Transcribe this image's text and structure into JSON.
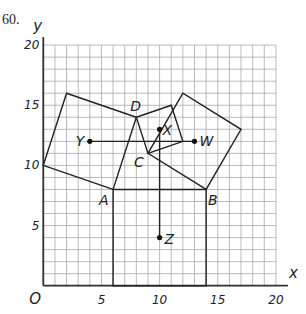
{
  "problem_number": "60.",
  "axes": {
    "x_label": "x",
    "y_label": "y",
    "origin_label": "O",
    "x_ticks": [
      {
        "v": 5,
        "label": "5"
      },
      {
        "v": 10,
        "label": "10"
      },
      {
        "v": 15,
        "label": "15"
      },
      {
        "v": 20,
        "label": "20"
      }
    ],
    "y_ticks": [
      {
        "v": 5,
        "label": "5"
      },
      {
        "v": 10,
        "label": "10"
      },
      {
        "v": 15,
        "label": "15"
      },
      {
        "v": 20,
        "label": "20"
      }
    ],
    "range": {
      "xmin": 0,
      "xmax": 20,
      "ymin": 0,
      "ymax": 20
    },
    "grid_step": 1
  },
  "quadrilateral": {
    "vertices": [
      {
        "name": "A",
        "x": 6,
        "y": 8
      },
      {
        "name": "B",
        "x": 14,
        "y": 8
      },
      {
        "name": "C",
        "x": 9,
        "y": 11
      },
      {
        "name": "D",
        "x": 8,
        "y": 14
      }
    ]
  },
  "squares": [
    {
      "side": "AB",
      "points": [
        [
          6,
          8
        ],
        [
          14,
          8
        ],
        [
          14,
          0
        ],
        [
          6,
          0
        ]
      ]
    },
    {
      "side": "BC",
      "points": [
        [
          14,
          8
        ],
        [
          9,
          11
        ],
        [
          12,
          16
        ],
        [
          17,
          13
        ]
      ]
    },
    {
      "side": "CD",
      "points": [
        [
          9,
          11
        ],
        [
          8,
          14
        ],
        [
          11,
          15
        ],
        [
          12,
          12
        ]
      ]
    },
    {
      "side": "DA",
      "points": [
        [
          8,
          14
        ],
        [
          6,
          8
        ],
        [
          0,
          10
        ],
        [
          2,
          16
        ]
      ]
    }
  ],
  "centers": [
    {
      "name": "W",
      "x": 13,
      "y": 12
    },
    {
      "name": "X",
      "x": 10,
      "y": 13
    },
    {
      "name": "Y",
      "x": 4,
      "y": 12
    },
    {
      "name": "Z",
      "x": 10,
      "y": 4
    }
  ],
  "segments": [
    {
      "from": "Y",
      "to": "W"
    },
    {
      "from": "X",
      "to": "Z"
    }
  ],
  "labels": {
    "A": "A",
    "B": "B",
    "C": "C",
    "D": "D",
    "W": "W",
    "X": "X",
    "Y": "Y",
    "Z": "Z"
  }
}
